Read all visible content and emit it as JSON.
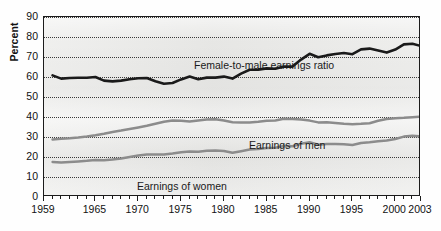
{
  "figure": {
    "ylabel": "Percent",
    "background_color": "#e9e9e7",
    "frame_color": "#1b1b1b"
  },
  "annotations": {
    "ratio": "Female-to-male earnings ratio",
    "men": "Earnings of men",
    "women": "Earnings of women"
  },
  "chart_data": {
    "type": "line",
    "title": "",
    "subtitle": "",
    "xlabel": "",
    "ylabel": "Percent",
    "xlim": [
      1959,
      2003
    ],
    "ylim": [
      0,
      90
    ],
    "grid": true,
    "grid_style": "dotted-horizontal",
    "legend": "inline-annotations",
    "ytick_labels": [
      "0",
      "10",
      "20",
      "30",
      "40",
      "50",
      "60",
      "70",
      "80",
      "90"
    ],
    "ytick_values": [
      0,
      10,
      20,
      30,
      40,
      50,
      60,
      70,
      80,
      90
    ],
    "xtick_labels": [
      "1959",
      "1965",
      "1970",
      "1975",
      "1980",
      "1985",
      "1990",
      "1995",
      "2000",
      "2003"
    ],
    "xtick_values": [
      1959,
      1965,
      1970,
      1975,
      1980,
      1985,
      1990,
      1995,
      2000,
      2003
    ],
    "minor_xticks": "every year 1959-2003",
    "x": [
      1960,
      1961,
      1962,
      1963,
      1964,
      1965,
      1966,
      1967,
      1968,
      1969,
      1970,
      1971,
      1972,
      1973,
      1974,
      1975,
      1976,
      1977,
      1978,
      1979,
      1980,
      1981,
      1982,
      1983,
      1984,
      1985,
      1986,
      1987,
      1988,
      1989,
      1990,
      1991,
      1992,
      1993,
      1994,
      1995,
      1996,
      1997,
      1998,
      1999,
      2000,
      2001,
      2002,
      2003
    ],
    "series": [
      {
        "name": "Female-to-male earnings ratio",
        "color": "#1a1a1a",
        "style": "thick-black",
        "values": [
          60.8,
          59.2,
          59.5,
          59.6,
          59.6,
          60.0,
          58.2,
          57.8,
          58.2,
          58.9,
          59.4,
          59.5,
          57.9,
          56.6,
          57.0,
          58.8,
          60.2,
          58.9,
          59.7,
          59.7,
          60.2,
          59.2,
          61.7,
          63.6,
          63.7,
          64.3,
          64.1,
          65.2,
          65.2,
          68.7,
          71.6,
          69.9,
          70.8,
          71.5,
          72.0,
          71.4,
          73.8,
          74.2,
          73.2,
          72.2,
          73.7,
          76.3,
          76.6,
          75.5
        ]
      },
      {
        "name": "Earnings of men",
        "color": "#8c8c8c",
        "style": "gray",
        "values": [
          28.8,
          29.1,
          29.4,
          29.8,
          30.3,
          30.9,
          31.6,
          32.5,
          33.2,
          34.0,
          34.8,
          35.6,
          36.6,
          37.6,
          38.2,
          38.1,
          37.8,
          38.3,
          38.7,
          38.9,
          38.2,
          37.4,
          37.2,
          37.3,
          37.6,
          38.1,
          38.3,
          39.1,
          39.0,
          38.7,
          38.2,
          37.3,
          37.4,
          37.0,
          36.6,
          36.4,
          36.6,
          36.9,
          38.1,
          39.0,
          39.4,
          39.6,
          39.9,
          40.2
        ]
      },
      {
        "name": "Earnings of women",
        "color": "#8c8c8c",
        "style": "gray",
        "values": [
          17.5,
          17.2,
          17.5,
          17.8,
          18.1,
          18.5,
          18.4,
          18.8,
          19.3,
          20.0,
          20.7,
          21.2,
          21.2,
          21.3,
          21.8,
          22.4,
          22.8,
          22.6,
          23.1,
          23.2,
          23.0,
          22.1,
          22.9,
          23.7,
          24.0,
          24.5,
          24.6,
          25.5,
          25.4,
          26.6,
          27.4,
          26.1,
          26.5,
          26.5,
          26.4,
          26.0,
          27.0,
          27.4,
          27.9,
          28.2,
          29.0,
          30.2,
          30.6,
          30.3
        ]
      }
    ]
  }
}
